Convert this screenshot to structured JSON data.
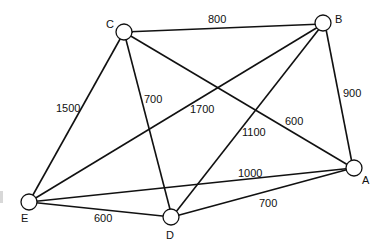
{
  "diagram": {
    "type": "weighted-undirected-graph",
    "nodes": [
      {
        "id": "A",
        "label": "A"
      },
      {
        "id": "B",
        "label": "B"
      },
      {
        "id": "C",
        "label": "C"
      },
      {
        "id": "D",
        "label": "D"
      },
      {
        "id": "E",
        "label": "E"
      }
    ],
    "edges": [
      {
        "from": "C",
        "to": "B",
        "weight": "800"
      },
      {
        "from": "B",
        "to": "A",
        "weight": "900"
      },
      {
        "from": "C",
        "to": "E",
        "weight": "1500"
      },
      {
        "from": "C",
        "to": "D",
        "weight": "700"
      },
      {
        "from": "C",
        "to": "A",
        "weight": "600"
      },
      {
        "from": "B",
        "to": "E",
        "weight": "1700"
      },
      {
        "from": "B",
        "to": "D",
        "weight": "1100"
      },
      {
        "from": "E",
        "to": "A",
        "weight": "1000"
      },
      {
        "from": "E",
        "to": "D",
        "weight": "600"
      },
      {
        "from": "D",
        "to": "A",
        "weight": "700"
      }
    ]
  }
}
